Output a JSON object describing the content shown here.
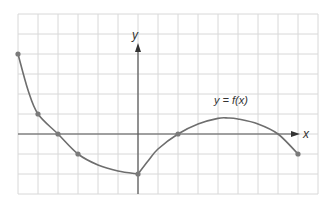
{
  "graph": {
    "title": "",
    "function_label": "y = f(x)",
    "x_axis_label": "x",
    "y_axis_label": "y",
    "grid": {
      "x_min": -6,
      "x_max": 9,
      "y_min": -3,
      "y_max": 6,
      "unit_px": 20,
      "origin_px": [
        138,
        134
      ],
      "color": "#d8d8d8"
    },
    "colors": {
      "curve": "#6e6e6e",
      "axis": "#555555",
      "points": "#7a7a7a"
    }
  },
  "chart_data": {
    "type": "line",
    "title": "y = f(x)",
    "xlabel": "x",
    "ylabel": "y",
    "xlim": [
      -6,
      9
    ],
    "ylim": [
      -3,
      6
    ],
    "grid": true,
    "series": [
      {
        "name": "f(x)",
        "x": [
          -6,
          -5.5,
          -5,
          -4,
          -3,
          -2,
          -1,
          0,
          0.5,
          1,
          2,
          3,
          4,
          4.5,
          5,
          6,
          7,
          8
        ],
        "y": [
          4,
          2.2,
          1,
          0,
          -1,
          -1.55,
          -1.85,
          -2,
          -1.35,
          -0.75,
          0,
          0.5,
          0.78,
          0.8,
          0.75,
          0.5,
          0,
          -1
        ]
      }
    ],
    "marked_points": [
      {
        "x": -6,
        "y": 4
      },
      {
        "x": -5,
        "y": 1
      },
      {
        "x": -4,
        "y": 0
      },
      {
        "x": -3,
        "y": -1
      },
      {
        "x": 0,
        "y": -2
      },
      {
        "x": 2,
        "y": 0
      },
      {
        "x": 8,
        "y": -1
      }
    ],
    "annotations": [
      {
        "text": "y = f(x)",
        "x": 4.5,
        "y": 1.7
      }
    ]
  }
}
